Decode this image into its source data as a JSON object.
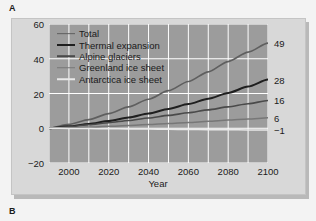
{
  "figure": {
    "panel_a_label": "A",
    "panel_b_label": "B"
  },
  "chart_data": {
    "type": "line",
    "title": "",
    "xlabel": "Year",
    "ylabel": "Sea-level change (cm)",
    "xlim": [
      1990,
      2100
    ],
    "ylim": [
      -20,
      60
    ],
    "xticks": [
      "2000",
      "2020",
      "2040",
      "2060",
      "2080",
      "2100"
    ],
    "xtick_values": [
      2000,
      2020,
      2040,
      2060,
      2080,
      2100
    ],
    "yticks": [
      "60",
      "40",
      "20",
      "0",
      "−20"
    ],
    "ytick_values": [
      60,
      40,
      20,
      0,
      -20
    ],
    "grid": true,
    "minor_grid_x_step": 10,
    "legend_position": "upper-left",
    "plot_bg_color": "#9c9c9c",
    "grid_color": "#ffffff",
    "x": [
      1990,
      2000,
      2010,
      2020,
      2030,
      2040,
      2050,
      2060,
      2070,
      2080,
      2090,
      2100
    ],
    "series": [
      {
        "name": "Total",
        "color": "#5f5f5f",
        "width": 1.7,
        "end_label": "49",
        "end_value": 49,
        "values": [
          0,
          2.2,
          5.0,
          8.4,
          12.3,
          16.7,
          21.6,
          26.9,
          32.5,
          38.4,
          43.8,
          49
        ]
      },
      {
        "name": "Thermal expansion",
        "color": "#1f1f1f",
        "width": 2.0,
        "end_label": "28",
        "end_value": 28,
        "values": [
          0,
          1.1,
          2.5,
          4.2,
          6.2,
          8.5,
          11.1,
          13.9,
          17.0,
          20.3,
          24.0,
          28
        ]
      },
      {
        "name": "Alpine glaciers",
        "color": "#4a4a4a",
        "width": 1.6,
        "end_label": "16",
        "end_value": 16,
        "values": [
          0,
          0.9,
          2.0,
          3.2,
          4.5,
          5.9,
          7.4,
          8.9,
          10.6,
          12.3,
          14.1,
          16
        ]
      },
      {
        "name": "Greenland ice sheet",
        "color": "#777777",
        "width": 1.5,
        "end_label": "6",
        "end_value": 6,
        "values": [
          0,
          0.3,
          0.7,
          1.1,
          1.6,
          2.1,
          2.7,
          3.3,
          4.0,
          4.7,
          5.3,
          6
        ]
      },
      {
        "name": "Antarctica ice sheet",
        "color": "#e8e8e8",
        "width": 1.5,
        "end_label": "−1",
        "end_value": -1,
        "values": [
          0,
          -0.1,
          -0.2,
          -0.3,
          -0.4,
          -0.5,
          -0.6,
          -0.7,
          -0.8,
          -0.9,
          -0.95,
          -1
        ]
      }
    ]
  }
}
